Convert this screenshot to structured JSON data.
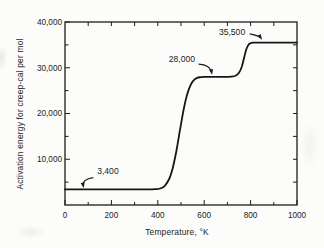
{
  "figure": {
    "background": "#fcfcfa",
    "ink": "#1d1d1d"
  },
  "chart_data": {
    "type": "line",
    "title": "",
    "xlabel": "Temperature, °K",
    "ylabel": "Activation energy for creep-cal per mol",
    "xlim": [
      0,
      1000
    ],
    "ylim": [
      0,
      40000
    ],
    "grid": false,
    "frame": "closed box, inward ticks on all four sides",
    "x_major_ticks": [
      0,
      200,
      400,
      600,
      800,
      1000
    ],
    "x_tick_labels": [
      "0",
      "200",
      "400",
      "600",
      "800",
      "1000"
    ],
    "x_minor_ticks": [
      100,
      300,
      500,
      700,
      900
    ],
    "x_top_ticks_every": 100,
    "y_major_ticks": [
      10000,
      20000,
      30000,
      40000
    ],
    "y_tick_labels": [
      "10,000",
      "20,000",
      "30,000",
      "40,000"
    ],
    "y_minor_ticks": [
      5000,
      15000,
      25000,
      35000
    ],
    "y_right_ticks_every": 5000,
    "plateaus": [
      3400,
      28000,
      35500
    ],
    "series": [
      {
        "name": "activation-energy-for-creep",
        "x": [
          0,
          50,
          100,
          150,
          200,
          250,
          300,
          350,
          390,
          410,
          430,
          450,
          465,
          480,
          495,
          510,
          525,
          540,
          555,
          570,
          585,
          600,
          630,
          660,
          690,
          715,
          735,
          750,
          762,
          772,
          782,
          792,
          802,
          812,
          850,
          900,
          950,
          1000
        ],
        "y": [
          3400,
          3400,
          3400,
          3400,
          3400,
          3400,
          3400,
          3400,
          3450,
          3600,
          4200,
          5800,
          8200,
          11800,
          16200,
          20500,
          23900,
          26100,
          27300,
          27800,
          27950,
          28000,
          28000,
          28000,
          28000,
          28050,
          28250,
          28900,
          30200,
          32200,
          34100,
          35100,
          35400,
          35500,
          35500,
          35500,
          35500,
          35500
        ]
      }
    ],
    "annotations": [
      {
        "text": "3,400",
        "label": {
          "x": 185,
          "y": 7400
        },
        "arrow": {
          "start": {
            "x": 122,
            "y": 6000
          },
          "ctrl": {
            "x": 74,
            "y": 5600
          },
          "tip": {
            "x": 80,
            "y": 3700
          }
        }
      },
      {
        "text": "28,000",
        "label": {
          "x": 504,
          "y": 31900
        },
        "arrow": {
          "start": {
            "x": 576,
            "y": 30800
          },
          "ctrl": {
            "x": 626,
            "y": 30600
          },
          "tip": {
            "x": 634,
            "y": 28450
          }
        }
      },
      {
        "text": "35,500",
        "label": {
          "x": 720,
          "y": 37800
        },
        "arrow": {
          "start": {
            "x": 796,
            "y": 37400
          },
          "ctrl": {
            "x": 839,
            "y": 36900
          },
          "tip": {
            "x": 849,
            "y": 36100
          }
        }
      }
    ]
  }
}
